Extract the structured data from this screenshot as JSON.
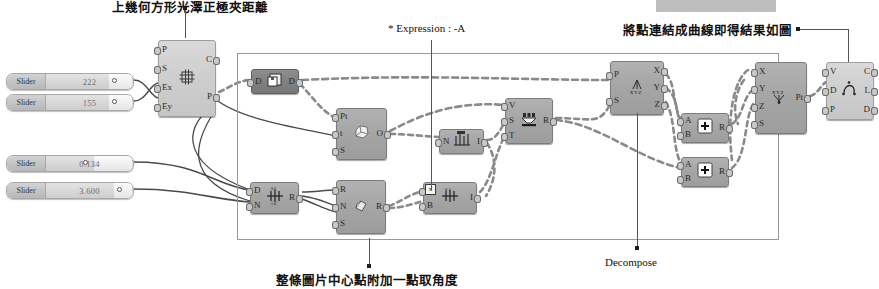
{
  "app": {
    "name": "Grasshopper canvas",
    "background": "#ffffff"
  },
  "annotations": [
    {
      "id": "top-left-note",
      "text": "上幾何方形光澤正極夾距離",
      "lang": "zh",
      "x": 112,
      "y": -2
    },
    {
      "id": "expression-note",
      "text": "* Expression : -A",
      "lang": "en",
      "x": 388,
      "y": 24
    },
    {
      "id": "curve-note",
      "text": "將點連結成曲線即得結果如圖",
      "lang": "zh",
      "x": 623,
      "y": 22
    },
    {
      "id": "decompose-note",
      "text": "Decompose",
      "lang": "en",
      "x": 605,
      "y": 258
    },
    {
      "id": "bottom-note",
      "text": "整條圖片中心點附加一點取角度",
      "lang": "zh",
      "x": 276,
      "y": 272
    }
  ],
  "sliders": [
    {
      "name": "slider-1",
      "label": "Slider",
      "value": "222",
      "x": 6,
      "y": 73,
      "w": 126,
      "knob_pct": 72,
      "fill_pct": 72,
      "knob_side": "right"
    },
    {
      "name": "slider-2",
      "label": "Slider",
      "value": "155",
      "x": 6,
      "y": 94,
      "w": 126,
      "knob_pct": 72,
      "fill_pct": 72,
      "knob_side": "right"
    },
    {
      "name": "slider-3",
      "label": "Slider",
      "value": "0.134",
      "x": 6,
      "y": 155,
      "w": 126,
      "knob_pct": 55,
      "fill_pct": 55,
      "knob_side": "left"
    },
    {
      "name": "slider-4",
      "label": "Slider",
      "value": "3.600",
      "x": 6,
      "y": 182,
      "w": 126,
      "knob_pct": 78,
      "fill_pct": 78,
      "knob_side": "right"
    }
  ],
  "group_box": {
    "name": "cluster-group",
    "x": 237,
    "y": 53,
    "w": 540,
    "h": 185
  },
  "redaction": {
    "x": 656,
    "y": 0,
    "w": 120,
    "h": 12
  },
  "components": [
    {
      "name": "rectangular-grid-node",
      "tone": "light",
      "x": 158,
      "y": 40,
      "w": 56,
      "h": 75,
      "inputs": [
        "P",
        "S",
        "Ex",
        "Ey"
      ],
      "outputs": [
        "C",
        "P"
      ],
      "icon": "grid-icon"
    },
    {
      "name": "divide-domain-node",
      "tone": "dark",
      "x": 251,
      "y": 69,
      "w": 46,
      "h": 23,
      "inputs": [
        "D"
      ],
      "outputs": [
        "D"
      ],
      "icon": "domain-icon"
    },
    {
      "name": "evaluate-surface-node",
      "tone": "normal",
      "x": 336,
      "y": 108,
      "w": 49,
      "h": 50,
      "inputs": [
        "Pt",
        "t",
        "S"
      ],
      "outputs": [
        "O"
      ],
      "icon": "surface-icon"
    },
    {
      "name": "range-node",
      "tone": "normal",
      "x": 439,
      "y": 129,
      "w": 43,
      "h": 23,
      "inputs": [
        "N"
      ],
      "outputs": [
        "I"
      ],
      "icon": "series-icon"
    },
    {
      "name": "divide-curve-node",
      "tone": "normal",
      "x": 250,
      "y": 182,
      "w": 47,
      "h": 30,
      "inputs": [
        "D",
        "N"
      ],
      "outputs": [
        "R"
      ],
      "icon": "divide-icon"
    },
    {
      "name": "rotate-node",
      "tone": "normal",
      "x": 336,
      "y": 180,
      "w": 48,
      "h": 52,
      "inputs": [
        "R",
        "N",
        "S"
      ],
      "outputs": [
        "R"
      ],
      "icon": "rotate-icon"
    },
    {
      "name": "expression-node",
      "tone": "normal",
      "x": 423,
      "y": 182,
      "w": 52,
      "h": 30,
      "inputs": [
        "A",
        "B"
      ],
      "outputs": [
        "I"
      ],
      "icon": "expression-icon",
      "badge": "expression-badge"
    },
    {
      "name": "series-node",
      "tone": "normal",
      "x": 505,
      "y": 98,
      "w": 46,
      "h": 44,
      "inputs": [
        "V",
        "S",
        "T"
      ],
      "outputs": [
        "R"
      ],
      "icon": "sort-icon"
    },
    {
      "name": "deconstruct-point-node",
      "tone": "normal",
      "x": 610,
      "y": 61,
      "w": 52,
      "h": 52,
      "inputs": [
        "P",
        "S"
      ],
      "outputs": [
        "X",
        "Y",
        "Z"
      ],
      "icon": "xyz-icon"
    },
    {
      "name": "addition-node-1",
      "tone": "normal",
      "x": 681,
      "y": 113,
      "w": 46,
      "h": 28,
      "inputs": [
        "A",
        "B"
      ],
      "outputs": [
        "R"
      ],
      "icon": "plus-icon"
    },
    {
      "name": "addition-node-2",
      "tone": "normal",
      "x": 681,
      "y": 157,
      "w": 46,
      "h": 28,
      "inputs": [
        "A",
        "B"
      ],
      "outputs": [
        "R"
      ],
      "icon": "plus-icon"
    },
    {
      "name": "construct-point-node",
      "tone": "normal",
      "x": 755,
      "y": 62,
      "w": 50,
      "h": 70,
      "inputs": [
        "X",
        "Y",
        "Z",
        "S"
      ],
      "outputs": [
        "Pt"
      ],
      "icon": "construct-xyz-icon"
    },
    {
      "name": "interpolate-curve-node",
      "tone": "light",
      "x": 826,
      "y": 62,
      "w": 46,
      "h": 56,
      "inputs": [
        "V",
        "D",
        "P"
      ],
      "outputs": [
        "C",
        "L",
        "D"
      ],
      "icon": "curve-icon"
    }
  ],
  "colors": {
    "node_fill": "#a6a6a6",
    "node_light": "#cfcfcf",
    "node_dark": "#828282",
    "wire_solid": "#4a4a4a",
    "wire_dashed": "#8a8a8a",
    "group_border": "#9a9a9a",
    "text": "#111111"
  }
}
